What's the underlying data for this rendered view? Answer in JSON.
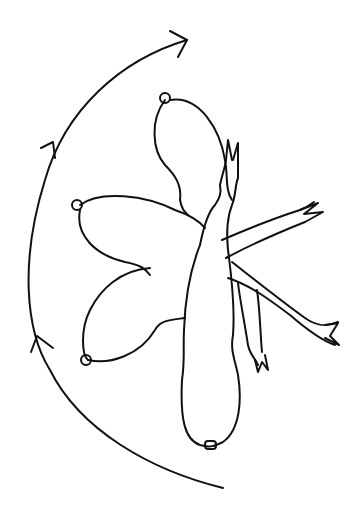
{
  "diagram": {
    "description": "Line drawing of four limb positions (bottle-shaped segments with claws) radiating from a common joint, with a curved arc of arrows on the left indicating clockwise rotation",
    "colors": {
      "background": "#ffffff",
      "ink": "#111111"
    },
    "arc": {
      "arrowheads": 3,
      "direction": "clockwise"
    },
    "limbs": [
      {
        "id": "upper",
        "position": "upper-center"
      },
      {
        "id": "left",
        "position": "left"
      },
      {
        "id": "lower-left",
        "position": "lower-left"
      },
      {
        "id": "bottom",
        "position": "bottom"
      }
    ],
    "appendages": [
      {
        "id": "claw-top",
        "position": "top",
        "pincer": true
      },
      {
        "id": "claw-right-upper",
        "position": "right-upper",
        "pincer": true
      },
      {
        "id": "claw-right-lower",
        "position": "right-lower",
        "pincer": true
      },
      {
        "id": "claw-down",
        "position": "lower-right",
        "pincer": true
      }
    ]
  }
}
